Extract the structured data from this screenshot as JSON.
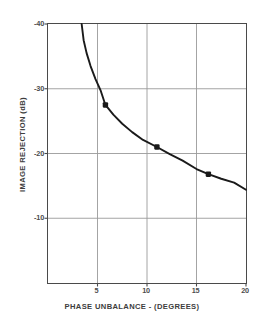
{
  "chart_data": {
    "type": "line",
    "title": "",
    "xlabel": "PHASE UNBALANCE - (DEGREES)",
    "ylabel": "IMAGE REJECTION (dB)",
    "xlim": [
      0,
      20
    ],
    "ylim": [
      -40,
      0
    ],
    "grid": true,
    "legend": null,
    "xticks": [
      {
        "value": 5,
        "label": "5"
      },
      {
        "value": 10,
        "label": "10"
      },
      {
        "value": 15,
        "label": "15"
      },
      {
        "value": 20,
        "label": "20"
      }
    ],
    "yticks": [
      {
        "value": -40,
        "label": "-40"
      },
      {
        "value": -30,
        "label": "-30"
      },
      {
        "value": -20,
        "label": "-20"
      },
      {
        "value": -10,
        "label": "-10"
      }
    ],
    "series": [
      {
        "name": "image rejection vs phase unbalance",
        "line": [
          {
            "x": 3.4,
            "y": -40.0
          },
          {
            "x": 3.6,
            "y": -37.5
          },
          {
            "x": 3.9,
            "y": -35.5
          },
          {
            "x": 4.3,
            "y": -33.5
          },
          {
            "x": 4.8,
            "y": -31.5
          },
          {
            "x": 5.3,
            "y": -29.8
          },
          {
            "x": 5.8,
            "y": -27.5
          },
          {
            "x": 6.6,
            "y": -26.0
          },
          {
            "x": 7.5,
            "y": -24.6
          },
          {
            "x": 8.5,
            "y": -23.3
          },
          {
            "x": 9.6,
            "y": -22.1
          },
          {
            "x": 11.0,
            "y": -21.0
          },
          {
            "x": 12.3,
            "y": -19.9
          },
          {
            "x": 13.6,
            "y": -18.9
          },
          {
            "x": 15.0,
            "y": -17.6
          },
          {
            "x": 16.2,
            "y": -16.8
          },
          {
            "x": 17.5,
            "y": -16.1
          },
          {
            "x": 18.8,
            "y": -15.5
          },
          {
            "x": 20.0,
            "y": -14.4
          }
        ],
        "markers": [
          {
            "x": 5.8,
            "y": -27.5
          },
          {
            "x": 11.0,
            "y": -21.0
          },
          {
            "x": 16.2,
            "y": -16.8
          }
        ]
      }
    ],
    "colors": {
      "curve": "#1a1a1a",
      "marker": "#1a1a1a",
      "grid": "#9a9a9a",
      "frame": "#4a4a4a",
      "text": "#4d4d4d",
      "background": "#ffffff"
    }
  }
}
